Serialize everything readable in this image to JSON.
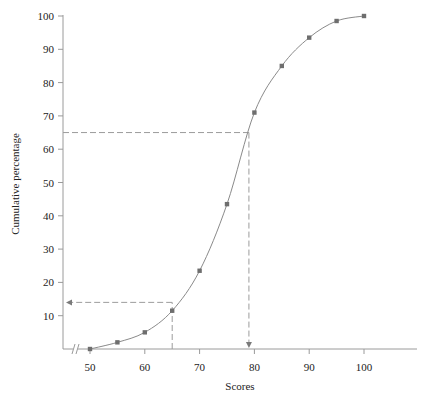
{
  "chart_data": {
    "type": "line",
    "title": "",
    "xlabel": "Scores",
    "ylabel": "Cumulative percentage",
    "x": [
      50,
      55,
      60,
      65,
      70,
      75,
      80,
      85,
      90,
      95,
      100
    ],
    "series": [
      {
        "name": "Cumulative percentage (ogive)",
        "values": [
          0,
          2,
          5,
          11.5,
          23.5,
          43.5,
          71,
          85,
          93.5,
          98.5,
          100
        ]
      }
    ],
    "x_ticks": [
      50,
      60,
      70,
      80,
      90,
      100
    ],
    "y_ticks": [
      10,
      20,
      30,
      40,
      50,
      60,
      70,
      80,
      90,
      100
    ],
    "xlim": [
      45,
      110
    ],
    "ylim": [
      0,
      100
    ],
    "grid": false,
    "legend": "none",
    "axis_break": "x-axis break (//) near origin",
    "annotations": [
      {
        "type": "guide",
        "description": "From score 65 up to curve, then left to y-axis (arrow)",
        "x": 65,
        "y": 14
      },
      {
        "type": "guide",
        "description": "From y-axis at 65% right to curve, then down to x-axis (arrow)",
        "x": 79,
        "y": 65
      }
    ]
  },
  "labels": {
    "xlabel": "Scores",
    "ylabel": "Cumulative percentage"
  },
  "x_tick_labels": [
    "50",
    "60",
    "70",
    "80",
    "90",
    "100"
  ],
  "y_tick_labels": [
    "10",
    "20",
    "30",
    "40",
    "50",
    "60",
    "70",
    "80",
    "90",
    "100"
  ]
}
